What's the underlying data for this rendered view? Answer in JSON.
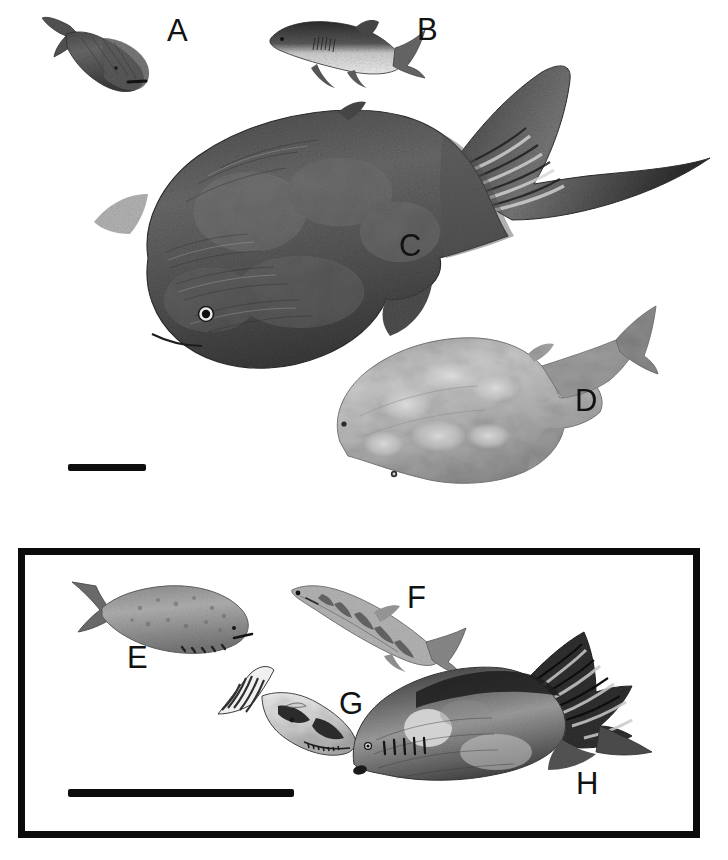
{
  "figure": {
    "background_color": "#ffffff",
    "ink_color": "#0d0d0d",
    "width": 728,
    "height": 860,
    "panel_count": 2
  },
  "labels": {
    "a": "A",
    "b": "B",
    "c": "C",
    "d": "D",
    "e": "E",
    "f": "F",
    "g": "G",
    "h": "H"
  },
  "specimens": [
    {
      "id": "A",
      "label": "A",
      "panel": "upper",
      "description": "small dark stippled fish, head lower-right, forked tail upper-left",
      "orientation": "head-down-right",
      "tone": "dark-mottled",
      "approx_box": [
        45,
        18,
        135,
        75
      ]
    },
    {
      "id": "B",
      "label": "B",
      "panel": "upper",
      "description": "small shark-like fish with pale belly and gill slits, head left",
      "orientation": "head-left",
      "tone": "dark-back-pale-belly",
      "approx_box": [
        265,
        18,
        155,
        75
      ]
    },
    {
      "id": "C",
      "label": "C",
      "panel": "upper",
      "description": "large dark heavily textured fish, head lower-left, large banded caudal fin upper-right",
      "orientation": "head-down-left",
      "tone": "dark-textured",
      "approx_box": [
        95,
        70,
        610,
        330
      ]
    },
    {
      "id": "D",
      "label": "D",
      "panel": "upper",
      "description": "pale mottled deep-bodied fish with slender caudal peduncle, head lower-left",
      "orientation": "head-down-left",
      "tone": "pale-mottled",
      "approx_box": [
        325,
        300,
        330,
        200
      ]
    },
    {
      "id": "E",
      "label": "E",
      "panel": "lower",
      "description": "stout speckled fish with forked tail, head right, gill openings along lower head",
      "orientation": "head-right",
      "tone": "mid-speckled",
      "approx_box": [
        68,
        570,
        190,
        95
      ]
    },
    {
      "id": "F",
      "label": "F",
      "panel": "lower",
      "description": "slender elongate barred fish, head upper-left, small forked tail lower-right",
      "orientation": "head-left",
      "tone": "banded",
      "approx_box": [
        292,
        582,
        175,
        95
      ]
    },
    {
      "id": "G",
      "label": "G",
      "panel": "lower",
      "description": "small fish with high striped dorsal/pectoral rays and dark blotches, head lower-right",
      "orientation": "head-down-right",
      "tone": "contrast-blotched",
      "approx_box": [
        215,
        668,
        145,
        95
      ]
    },
    {
      "id": "H",
      "label": "H",
      "panel": "lower",
      "description": "deep-bodied fish with tall serrated dorsal crest and pale flank spots, head lower-left",
      "orientation": "head-down-left",
      "tone": "dark-with-pale-spots",
      "approx_box": [
        350,
        640,
        300,
        160
      ]
    }
  ],
  "scale_bars": [
    {
      "id": "upper-scale-bar",
      "panel": "upper",
      "x": 68,
      "y": 464,
      "length_px": 78,
      "thickness_px": 7,
      "color": "#0d0d0d"
    },
    {
      "id": "lower-scale-bar",
      "panel": "lower",
      "x": 68,
      "y": 789,
      "length_px": 226,
      "thickness_px": 8,
      "color": "#0d0d0d"
    }
  ],
  "panels": {
    "upper": {
      "name": "upper-panel",
      "bordered": false,
      "members": [
        "A",
        "B",
        "C",
        "D"
      ]
    },
    "lower": {
      "name": "lower-panel",
      "bordered": true,
      "border_color": "#0b0b0b",
      "border_width_px": 7,
      "members": [
        "E",
        "F",
        "G",
        "H"
      ]
    }
  }
}
